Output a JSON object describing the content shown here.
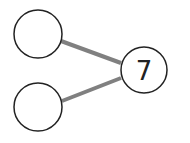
{
  "diagram": {
    "type": "number-bond",
    "whole": {
      "value": "7"
    },
    "parts": [
      {
        "value": ""
      },
      {
        "value": ""
      }
    ],
    "colors": {
      "circle_stroke": "#222222",
      "connector": "#808080",
      "text": "#222222"
    }
  }
}
